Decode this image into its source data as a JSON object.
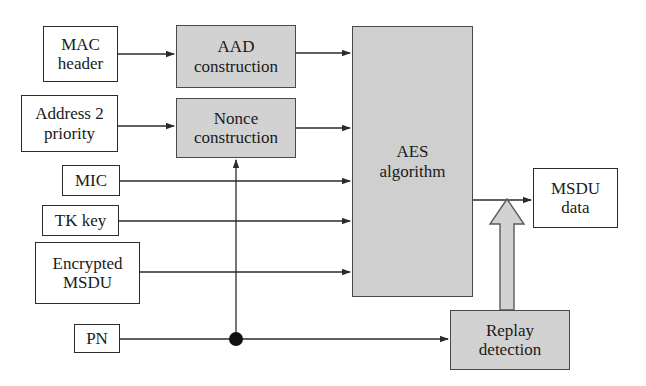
{
  "diagram": {
    "colors": {
      "shaded_fill": "#d2d2d2",
      "aes_fill": "#cfcfcf",
      "plain_fill": "#ffffff",
      "line": "#2b2b2b",
      "border": "#4a4a4a"
    },
    "nodes": [
      {
        "id": "mac-header",
        "label": "MAC\nheader",
        "style": "plain",
        "x": 43,
        "y": 26,
        "w": 75,
        "h": 56
      },
      {
        "id": "address2-priority",
        "label": "Address 2\npriority",
        "style": "plain",
        "x": 21,
        "y": 95,
        "w": 97,
        "h": 57
      },
      {
        "id": "mic",
        "label": "MIC",
        "style": "plain",
        "x": 62,
        "y": 165,
        "w": 58,
        "h": 31
      },
      {
        "id": "tk-key",
        "label": "TK key",
        "style": "plain",
        "x": 42,
        "y": 205,
        "w": 77,
        "h": 31
      },
      {
        "id": "encrypted-msdu",
        "label": "Encrypted\nMSDU",
        "style": "plain",
        "x": 35,
        "y": 242,
        "w": 105,
        "h": 62
      },
      {
        "id": "pn",
        "label": "PN",
        "style": "plain",
        "x": 74,
        "y": 324,
        "w": 46,
        "h": 29
      },
      {
        "id": "aad-construction",
        "label": "AAD\nconstruction",
        "style": "shaded",
        "x": 176,
        "y": 25,
        "w": 120,
        "h": 63
      },
      {
        "id": "nonce-construction",
        "label": "Nonce\nconstruction",
        "style": "shaded",
        "x": 176,
        "y": 98,
        "w": 120,
        "h": 60
      },
      {
        "id": "aes-algorithm",
        "label": "AES\nalgorithm",
        "style": "aes",
        "x": 352,
        "y": 26,
        "w": 121,
        "h": 271
      },
      {
        "id": "msdu-data",
        "label": "MSDU\ndata",
        "style": "plain",
        "x": 533,
        "y": 168,
        "w": 85,
        "h": 60
      },
      {
        "id": "replay-detection",
        "label": "Replay\ndetection",
        "style": "shaded",
        "x": 450,
        "y": 310,
        "w": 120,
        "h": 60
      }
    ],
    "connections": [
      {
        "id": "mac-header-to-aad",
        "from": "mac-header",
        "to": "aad-construction",
        "kind": "thin-arrow"
      },
      {
        "id": "address2-to-nonce",
        "from": "address2-priority",
        "to": "nonce-construction",
        "kind": "thin-arrow"
      },
      {
        "id": "aad-to-aes",
        "from": "aad-construction",
        "to": "aes-algorithm",
        "kind": "thin-arrow"
      },
      {
        "id": "nonce-to-aes",
        "from": "nonce-construction",
        "to": "aes-algorithm",
        "kind": "thin-arrow"
      },
      {
        "id": "mic-to-aes",
        "from": "mic",
        "to": "aes-algorithm",
        "kind": "thin-arrow"
      },
      {
        "id": "tk-key-to-aes",
        "from": "tk-key",
        "to": "aes-algorithm",
        "kind": "thin-arrow"
      },
      {
        "id": "encrypted-msdu-to-aes",
        "from": "encrypted-msdu",
        "to": "aes-algorithm",
        "kind": "thin-arrow"
      },
      {
        "id": "pn-to-replay-detection",
        "from": "pn",
        "to": "replay-detection",
        "kind": "thin-arrow"
      },
      {
        "id": "pn-branch-to-nonce",
        "from": "pn",
        "to": "nonce-construction",
        "kind": "thin-arrow-branch"
      },
      {
        "id": "aes-to-msdu-data",
        "from": "aes-algorithm",
        "to": "msdu-data",
        "kind": "thin-arrow"
      },
      {
        "id": "replay-detection-to-output",
        "from": "replay-detection",
        "to": "aes-to-msdu-data",
        "kind": "block-arrow"
      }
    ],
    "junctions": [
      {
        "id": "pn-junction",
        "x": 236,
        "y": 339,
        "r": 7
      }
    ]
  }
}
